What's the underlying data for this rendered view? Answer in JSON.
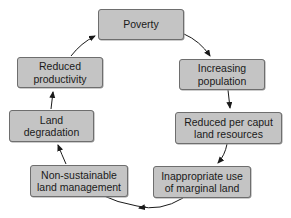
{
  "diagram": {
    "type": "cycle",
    "nodes": [
      {
        "id": "poverty",
        "label": "Poverty"
      },
      {
        "id": "increasing-population",
        "label": "Increasing population"
      },
      {
        "id": "reduced-land-resources",
        "label": "Reduced per caput land resources"
      },
      {
        "id": "inappropriate-use",
        "label": "Inappropriate use of marginal land"
      },
      {
        "id": "non-sustainable",
        "label": "Non-sustainable land management"
      },
      {
        "id": "land-degradation",
        "label": "Land degradation"
      },
      {
        "id": "reduced-productivity",
        "label": "Reduced productivity"
      }
    ],
    "colors": {
      "box_fill": "#c4c4c4",
      "box_border": "#6e6e6e",
      "arrow": "#1a1a1a"
    }
  }
}
